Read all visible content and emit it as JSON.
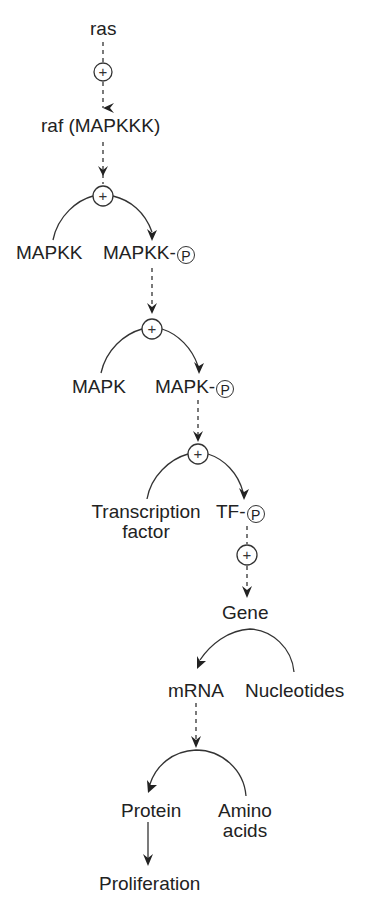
{
  "diagram": {
    "colors": {
      "ink": "#222222",
      "background": "#ffffff"
    },
    "nodes": {
      "ras": "ras",
      "raf": "raf (MAPKKK)",
      "mapkk": "MAPKK",
      "mapkk_p": "MAPKK-",
      "mapk": "MAPK",
      "mapk_p": "MAPK-",
      "tf_line1": "Transcription",
      "tf_line2": "factor",
      "tf_p": "TF-",
      "gene": "Gene",
      "mrna": "mRNA",
      "nucleotides": "Nucleotides",
      "protein": "Protein",
      "amino_line1": "Amino",
      "amino_line2": "acids",
      "proliferation": "Proliferation"
    },
    "symbols": {
      "phospho": "P",
      "activate": "+"
    },
    "edges": [
      {
        "from": "ras",
        "to": "raf",
        "style": "dashed",
        "mark": "+"
      },
      {
        "from": "raf",
        "to": "MAPKK→MAPKK-P",
        "style": "dashed",
        "mark": "+"
      },
      {
        "from": "MAPKK",
        "to": "MAPKK-P",
        "style": "arc"
      },
      {
        "from": "MAPKK-P",
        "to": "MAPK→MAPK-P",
        "style": "dashed",
        "mark": "+"
      },
      {
        "from": "MAPK",
        "to": "MAPK-P",
        "style": "arc"
      },
      {
        "from": "MAPK-P",
        "to": "TF→TF-P",
        "style": "dashed",
        "mark": "+"
      },
      {
        "from": "Transcription factor",
        "to": "TF-P",
        "style": "arc"
      },
      {
        "from": "TF-P",
        "to": "Gene",
        "style": "dashed",
        "mark": "+"
      },
      {
        "from": "Nucleotides",
        "to": "mRNA",
        "style": "arc",
        "via": "Gene"
      },
      {
        "from": "mRNA",
        "to": "Amino acids→Protein",
        "style": "dashed"
      },
      {
        "from": "Amino acids",
        "to": "Protein",
        "style": "arc"
      },
      {
        "from": "Protein",
        "to": "Proliferation",
        "style": "solid"
      }
    ]
  }
}
